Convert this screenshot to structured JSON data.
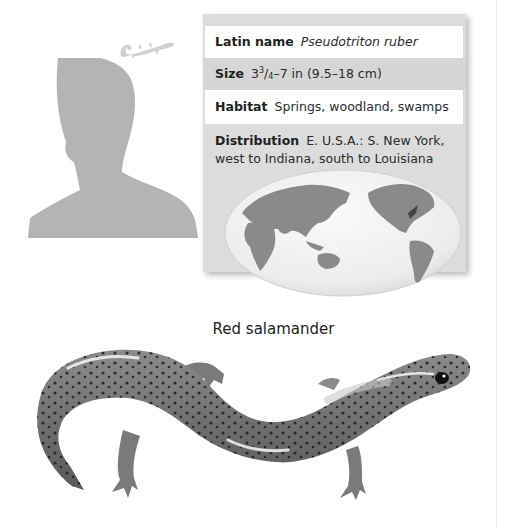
{
  "profile": {
    "common_name": "Red salamander",
    "silhouette_icon": "human-silhouette-scale-icon",
    "scale_icon": "salamander-scale-icon"
  },
  "info_panel": {
    "latin_name": {
      "label": "Latin name",
      "value": "Pseudotriton ruber"
    },
    "size": {
      "label": "Size",
      "value_whole": "3",
      "value_num": "3",
      "value_den": "4",
      "value_rest": "–7 in (9.5–18 cm)"
    },
    "habitat": {
      "label": "Habitat",
      "value": "Springs, woodland, swamps"
    },
    "distribution": {
      "label": "Distribution",
      "value_line1": "E. U.S.A.: S. New York,",
      "value_line2": "west to Indiana, south to Louisiana"
    },
    "map": {
      "icon": "world-map-icon",
      "highlight_region": "Eastern U.S.A."
    }
  },
  "colors": {
    "panel_bg": "#dcdcdc",
    "row_white": "#ffffff",
    "silhouette": "#b4b4b4",
    "land": "#8a8a8a",
    "range_highlight": "#444444"
  }
}
